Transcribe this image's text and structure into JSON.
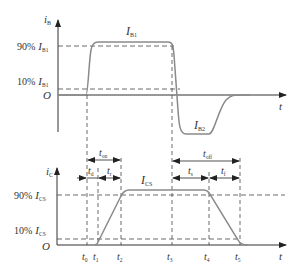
{
  "diagram": {
    "colors": {
      "axis": "#333333",
      "curve": "#8a8a8a",
      "dash": "#444444",
      "text": "#333333"
    },
    "top_plot": {
      "y_axis_label": "i",
      "y_axis_sub": "B",
      "x_axis_label": "t",
      "origin_label": "O",
      "level_90_pct": "90%",
      "level_90_sym": "I",
      "level_90_sub": "B1",
      "level_10_pct": "10%",
      "level_10_sym": "I",
      "level_10_sub": "B1",
      "peak_label_sym": "I",
      "peak_label_sub": "B1",
      "negative_label_sym": "I",
      "negative_label_sub": "B2"
    },
    "bottom_plot": {
      "y_axis_label": "i",
      "y_axis_sub": "C",
      "x_axis_label": "t",
      "origin_label": "O",
      "level_90_pct": "90%",
      "level_90_sym": "I",
      "level_90_sub": "CS",
      "level_10_pct": "10%",
      "level_10_sym": "I",
      "level_10_sub": "CS",
      "peak_label_sym": "I",
      "peak_label_sub": "CS",
      "time_marks": [
        {
          "sym": "t",
          "sub": "0"
        },
        {
          "sym": "t",
          "sub": "1"
        },
        {
          "sym": "t",
          "sub": "2"
        },
        {
          "sym": "t",
          "sub": "3"
        },
        {
          "sym": "t",
          "sub": "4"
        },
        {
          "sym": "t",
          "sub": "5"
        }
      ],
      "intervals": {
        "t_on": {
          "sym": "t",
          "sub": "on"
        },
        "t_d": {
          "sym": "t",
          "sub": "d"
        },
        "t_r": {
          "sym": "t",
          "sub": "r"
        },
        "t_off": {
          "sym": "t",
          "sub": "off"
        },
        "t_s": {
          "sym": "t",
          "sub": "s"
        },
        "t_f": {
          "sym": "t",
          "sub": "f"
        }
      }
    }
  }
}
